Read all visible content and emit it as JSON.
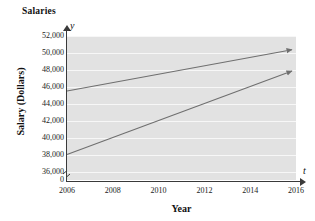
{
  "chart_data": {
    "type": "line",
    "title": "Salaries",
    "xlabel": "Year",
    "ylabel": "Salary (Dollars)",
    "x_axis_letter": "t",
    "y_axis_letter": "y",
    "xlim": [
      2006,
      2016
    ],
    "ylim": [
      35000,
      52000
    ],
    "y_axis_break_at_zero": true,
    "y_zero_label": "0",
    "grid": true,
    "grid_orientation": "horizontal",
    "legend": "none",
    "xticks": [
      {
        "value": 2006,
        "label": "2006"
      },
      {
        "value": 2008,
        "label": "2008"
      },
      {
        "value": 2010,
        "label": "2010"
      },
      {
        "value": 2012,
        "label": "2012"
      },
      {
        "value": 2014,
        "label": "2014"
      },
      {
        "value": 2016,
        "label": "2016"
      }
    ],
    "yticks": [
      {
        "value": 52000,
        "label": "52,000"
      },
      {
        "value": 50000,
        "label": "50,000"
      },
      {
        "value": 48000,
        "label": "48,000"
      },
      {
        "value": 46000,
        "label": "46,000"
      },
      {
        "value": 44000,
        "label": "44,000"
      },
      {
        "value": 42000,
        "label": "42,000"
      },
      {
        "value": 40000,
        "label": "40,000"
      },
      {
        "value": 38000,
        "label": "38,000"
      },
      {
        "value": 36000,
        "label": "36,000"
      }
    ],
    "series": [
      {
        "name": "upper-line",
        "color": "#6f6f6f",
        "arrow_end": true,
        "x": [
          2006,
          2016
        ],
        "values": [
          45500,
          50300
        ]
      },
      {
        "name": "lower-line",
        "color": "#6f6f6f",
        "arrow_end": true,
        "x": [
          2006,
          2016
        ],
        "values": [
          38000,
          47700
        ]
      }
    ],
    "colors": {
      "plot_background": "#e2e2e2",
      "gridline": "#f7f7f7",
      "axis": "#3a3a3a",
      "line": "#6f6f6f",
      "text": "#111111",
      "page_background": "#ffffff"
    }
  }
}
